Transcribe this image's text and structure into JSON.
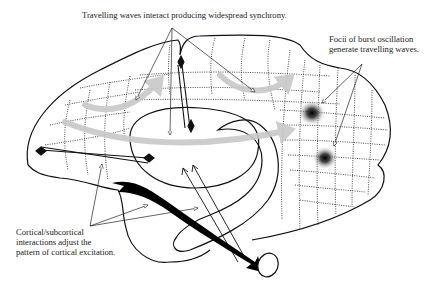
{
  "figure": {
    "type": "brain-sagittal-schematic",
    "annotations": {
      "top": "Travelling waves interact producing widespread synchrony.",
      "right_line1": "Focii of burst oscillation",
      "right_line2": "generate travelling waves.",
      "left_line1": "Cortical/subcortical",
      "left_line2": "interactions adjust the",
      "left_line3": "pattern of cortical excitation."
    },
    "colors": {
      "outline": "#111111",
      "wave_arrows": "#c8c8c8",
      "focus_spots": "#000000",
      "background": "#ffffff"
    },
    "elements": {
      "cortex_outline": "cortex",
      "dotted_grid": "cortical-sheet-grid",
      "burst_foci_count": 2,
      "gray_wave_arrows_count": 4,
      "bidirectional_connections_count": 2,
      "black_projection": "thick-black-arrow",
      "brainstem": "brainstem-ellipse"
    }
  }
}
